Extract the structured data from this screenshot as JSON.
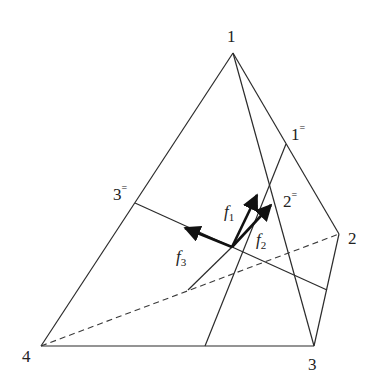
{
  "diagram": {
    "type": "tetrahedron-force-diagram",
    "vertices": [
      {
        "id": "1",
        "label": "1",
        "x": 233,
        "y": 53,
        "label_x": 227,
        "label_y": 42
      },
      {
        "id": "2",
        "label": "2",
        "x": 339,
        "y": 234,
        "label_x": 348,
        "label_y": 244
      },
      {
        "id": "3",
        "label": "3",
        "x": 314,
        "y": 346,
        "label_x": 308,
        "label_y": 370
      },
      {
        "id": "4",
        "label": "4",
        "x": 41,
        "y": 346,
        "label_x": 22,
        "label_y": 362
      }
    ],
    "face_points": [
      {
        "id": "1=",
        "label": "1",
        "mark": "=",
        "x": 286,
        "y": 144,
        "label_x": 291,
        "label_y": 140
      },
      {
        "id": "2=",
        "label": "2",
        "mark": "=",
        "x": 272,
        "y": 207,
        "label_x": 283,
        "label_y": 207
      },
      {
        "id": "3=",
        "label": "3",
        "mark": "=",
        "x": 135,
        "y": 203,
        "label_x": 113,
        "label_y": 200
      }
    ],
    "center": {
      "x": 232,
      "y": 247
    },
    "forces": [
      {
        "id": "f1",
        "label": "f",
        "subscript": "1",
        "tip_x": 257,
        "tip_y": 195,
        "label_x": 224,
        "label_y": 217
      },
      {
        "id": "f2",
        "label": "f",
        "subscript": "2",
        "tip_x": 271,
        "tip_y": 205,
        "label_x": 256,
        "label_y": 245
      },
      {
        "id": "f3",
        "label": "f",
        "subscript": "3",
        "tip_x": 185,
        "tip_y": 228,
        "label_x": 176,
        "label_y": 262
      }
    ],
    "colors": {
      "line": "#2b2b2b",
      "arrow": "#111111",
      "background": "#ffffff"
    }
  }
}
